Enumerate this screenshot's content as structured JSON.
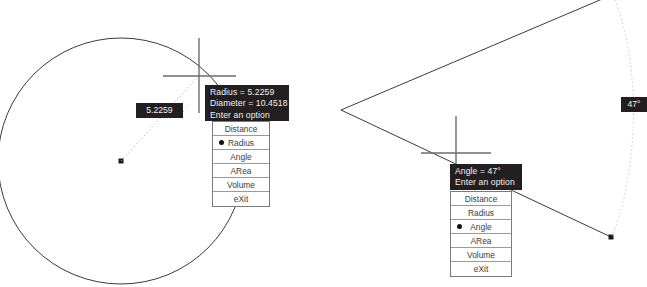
{
  "app": {
    "background_color": "#ffffff",
    "line_color": "#3b3b3b",
    "tooltip_background": "#231f20",
    "tooltip_text_color": "#f2f2f2",
    "menu_border_color": "#7a7a7a"
  },
  "left_panel": {
    "name": "circle-radius-measurement",
    "tooltip": {
      "line1": "Radius = 5.2259",
      "line2": "Diameter = 10.4518",
      "line3": "Enter an option"
    },
    "value_tag": "5.2259",
    "menu": {
      "items": [
        {
          "label": "Distance",
          "selected": false
        },
        {
          "label": "Radius",
          "selected": true
        },
        {
          "label": "Angle",
          "selected": false
        },
        {
          "label": "ARea",
          "selected": false
        },
        {
          "label": "Volume",
          "selected": false
        },
        {
          "label": "eXit",
          "selected": false
        }
      ]
    },
    "geometry": {
      "circle_center_x": 121,
      "circle_center_y": 161,
      "circle_radius": 123,
      "crosshair_x": 199,
      "crosshair_y": 76
    }
  },
  "right_panel": {
    "name": "angle-measurement",
    "tooltip": {
      "line1": "Angle = 47°",
      "line2": "Enter an option"
    },
    "value_tag": "47°",
    "menu": {
      "items": [
        {
          "label": "Distance",
          "selected": false
        },
        {
          "label": "Radius",
          "selected": false
        },
        {
          "label": "Angle",
          "selected": true
        },
        {
          "label": "ARea",
          "selected": false
        },
        {
          "label": "Volume",
          "selected": false
        },
        {
          "label": "eXit",
          "selected": false
        }
      ]
    },
    "geometry": {
      "vertex_x": 341,
      "vertex_y": 110,
      "ray1_end_x": 604,
      "ray1_end_y": -2,
      "ray2_end_x": 611,
      "ray2_end_y": 237,
      "crosshair_x": 456,
      "crosshair_y": 153
    }
  }
}
